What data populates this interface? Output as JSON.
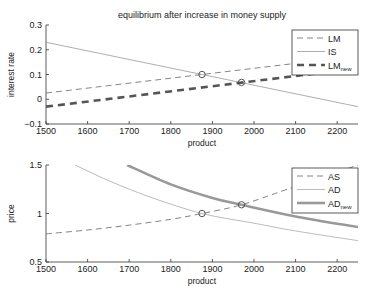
{
  "chart_data": [
    {
      "type": "line",
      "title": "equilibrium after increase in money supply",
      "xlabel": "product",
      "ylabel": "interest rate",
      "xlim": [
        1500,
        2250
      ],
      "ylim": [
        -0.1,
        0.3
      ],
      "xticks": [
        1500,
        1600,
        1700,
        1800,
        1900,
        2000,
        2100,
        2200
      ],
      "yticks": [
        -0.1,
        0,
        0.1,
        0.2,
        0.3
      ],
      "ytick_labels": [
        "−0.1",
        "0",
        "0.1",
        "0.2",
        "0.3"
      ],
      "grid": false,
      "legend_position": "upper right",
      "series": [
        {
          "name": "LM",
          "style": "dashed-thin",
          "color": "#777777",
          "x": [
            1500,
            2250
          ],
          "y": [
            0.025,
            0.175
          ]
        },
        {
          "name": "IS",
          "style": "solid-thin",
          "color": "#999999",
          "x": [
            1500,
            2250
          ],
          "y": [
            0.23,
            -0.03
          ]
        },
        {
          "name": "LM",
          "sub": "new",
          "style": "dashed-thick",
          "color": "#555555",
          "x": [
            1500,
            2250
          ],
          "y": [
            -0.03,
            0.125
          ]
        }
      ],
      "markers": [
        {
          "x": 1875,
          "y": 0.1
        },
        {
          "x": 1970,
          "y": 0.068
        }
      ]
    },
    {
      "type": "line",
      "title": "",
      "xlabel": "product",
      "ylabel": "price",
      "xlim": [
        1500,
        2250
      ],
      "ylim": [
        0.5,
        1.5
      ],
      "xticks": [
        1500,
        1600,
        1700,
        1800,
        1900,
        2000,
        2100,
        2200
      ],
      "yticks": [
        0.5,
        1,
        1.5
      ],
      "ytick_labels": [
        "0.5",
        "1",
        "1.5"
      ],
      "grid": false,
      "legend_position": "upper right",
      "series": [
        {
          "name": "AS",
          "style": "dashed-thin",
          "color": "#777777",
          "x": [
            1500,
            1600,
            1700,
            1800,
            1875,
            1970,
            2080,
            2250
          ],
          "y": [
            0.79,
            0.83,
            0.88,
            0.94,
            1.0,
            1.09,
            1.25,
            1.5
          ]
        },
        {
          "name": "AD",
          "style": "solid-thin",
          "color": "#aaaaaa",
          "x": [
            1570,
            1650,
            1750,
            1875,
            2000,
            2100,
            2250
          ],
          "y": [
            1.5,
            1.34,
            1.17,
            1.0,
            0.9,
            0.82,
            0.72
          ]
        },
        {
          "name": "AD",
          "sub": "new",
          "style": "solid-thick",
          "color": "#999999",
          "x": [
            1695,
            1800,
            1900,
            1970,
            2100,
            2250
          ],
          "y": [
            1.5,
            1.3,
            1.16,
            1.09,
            0.97,
            0.86
          ]
        }
      ],
      "markers": [
        {
          "x": 1875,
          "y": 1.0
        },
        {
          "x": 1970,
          "y": 1.09
        }
      ]
    }
  ]
}
